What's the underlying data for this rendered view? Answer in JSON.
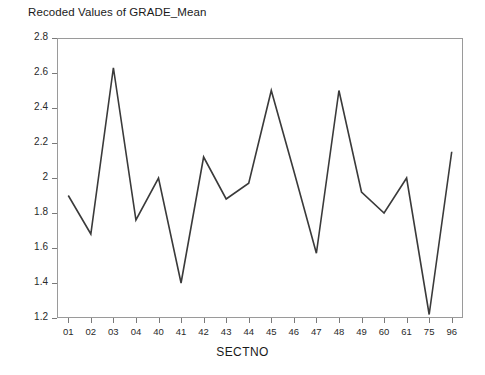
{
  "chart_data": {
    "type": "line",
    "title": "Recoded Values of GRADE_Mean",
    "xlabel": "SECTNO",
    "ylabel": "",
    "categories": [
      "01",
      "02",
      "03",
      "04",
      "40",
      "41",
      "42",
      "43",
      "44",
      "45",
      "46",
      "47",
      "48",
      "49",
      "60",
      "61",
      "75",
      "96"
    ],
    "values": [
      1.9,
      1.68,
      2.63,
      1.76,
      2.0,
      1.4,
      2.12,
      1.88,
      1.97,
      2.5,
      2.04,
      1.57,
      2.5,
      1.92,
      1.8,
      2.0,
      1.22,
      2.15
    ],
    "series": [
      {
        "name": "GRADE_Mean",
        "values": [
          1.9,
          1.68,
          2.63,
          1.76,
          2.0,
          1.4,
          2.12,
          1.88,
          1.97,
          2.5,
          2.04,
          1.57,
          2.5,
          1.92,
          1.8,
          2.0,
          1.22,
          2.15
        ]
      }
    ],
    "ylim": [
      1.2,
      2.8
    ],
    "yticks": [
      1.2,
      1.4,
      1.6,
      1.8,
      2,
      2.2,
      2.4,
      2.6,
      2.8
    ],
    "ytick_labels": [
      "1.2",
      "1.4",
      "1.6",
      "1.8",
      "2",
      "2.2",
      "2.4",
      "2.6",
      "2.8"
    ],
    "grid": false,
    "legend": "none",
    "line_color": "#3a3a3a",
    "frame_color": "#9a9a9a",
    "background_color": "#ffffff"
  }
}
